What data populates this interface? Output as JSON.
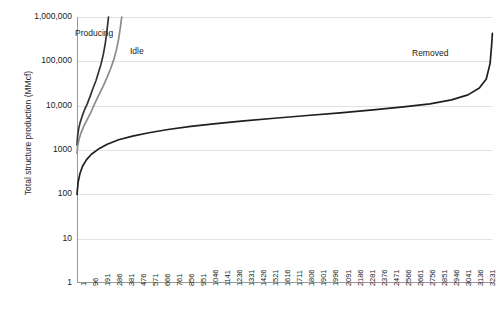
{
  "chart_data": {
    "type": "line",
    "title": "",
    "xlabel": "",
    "ylabel": "Total structure production (MMcf)",
    "yscale": "log",
    "ylim": [
      1,
      1000000
    ],
    "xlim": [
      1,
      3280
    ],
    "grid": true,
    "legend_position": "inline-annotations",
    "y_tick_labels": [
      "1,000,000",
      "100,000",
      "10,000",
      "1000",
      "100",
      "10",
      "1"
    ],
    "y_tick_values": [
      1000000,
      100000,
      10000,
      1000,
      100,
      10,
      1
    ],
    "x_tick_labels": [
      "1",
      "96",
      "191",
      "286",
      "381",
      "476",
      "571",
      "666",
      "761",
      "856",
      "951",
      "1046",
      "1141",
      "1236",
      "1331",
      "1426",
      "1521",
      "1616",
      "1711",
      "1806",
      "1901",
      "1996",
      "2091",
      "2186",
      "2281",
      "2376",
      "2471",
      "2566",
      "2661",
      "2756",
      "2851",
      "2946",
      "3041",
      "3136",
      "3231"
    ],
    "x_tick_values": [
      1,
      96,
      191,
      286,
      381,
      476,
      571,
      666,
      761,
      856,
      951,
      1046,
      1141,
      1236,
      1331,
      1426,
      1521,
      1616,
      1711,
      1806,
      1901,
      1996,
      2091,
      2186,
      2281,
      2376,
      2471,
      2566,
      2661,
      2756,
      2851,
      2946,
      3041,
      3136,
      3231
    ],
    "series": [
      {
        "name": "Producing",
        "color": "#333333",
        "label_position": {
          "x": 75,
          "y": 28
        },
        "points": [
          {
            "x": 1,
            "y": 1300
          },
          {
            "x": 6,
            "y": 2100
          },
          {
            "x": 14,
            "y": 3000
          },
          {
            "x": 26,
            "y": 4200
          },
          {
            "x": 42,
            "y": 5800
          },
          {
            "x": 60,
            "y": 8000
          },
          {
            "x": 82,
            "y": 11000
          },
          {
            "x": 104,
            "y": 16000
          },
          {
            "x": 126,
            "y": 24000
          },
          {
            "x": 150,
            "y": 36000
          },
          {
            "x": 170,
            "y": 55000
          },
          {
            "x": 190,
            "y": 85000
          },
          {
            "x": 208,
            "y": 140000
          },
          {
            "x": 222,
            "y": 230000
          },
          {
            "x": 232,
            "y": 360000
          },
          {
            "x": 240,
            "y": 560000
          },
          {
            "x": 246,
            "y": 800000
          },
          {
            "x": 250,
            "y": 1000000
          }
        ]
      },
      {
        "name": "Idle",
        "color": "#8c8c8c",
        "label_position": {
          "x": 130,
          "y": 46
        },
        "points": [
          {
            "x": 1,
            "y": 850
          },
          {
            "x": 6,
            "y": 1200
          },
          {
            "x": 16,
            "y": 1700
          },
          {
            "x": 32,
            "y": 2400
          },
          {
            "x": 54,
            "y": 3400
          },
          {
            "x": 80,
            "y": 4800
          },
          {
            "x": 110,
            "y": 7000
          },
          {
            "x": 140,
            "y": 11000
          },
          {
            "x": 172,
            "y": 17000
          },
          {
            "x": 206,
            "y": 27000
          },
          {
            "x": 238,
            "y": 43000
          },
          {
            "x": 268,
            "y": 70000
          },
          {
            "x": 294,
            "y": 115000
          },
          {
            "x": 314,
            "y": 190000
          },
          {
            "x": 330,
            "y": 320000
          },
          {
            "x": 342,
            "y": 540000
          },
          {
            "x": 350,
            "y": 820000
          },
          {
            "x": 355,
            "y": 1000000
          }
        ]
      },
      {
        "name": "Removed",
        "color": "#1f1f1f",
        "label_position": {
          "x": 412,
          "y": 48
        },
        "points": [
          {
            "x": 1,
            "y": 100
          },
          {
            "x": 10,
            "y": 190
          },
          {
            "x": 25,
            "y": 300
          },
          {
            "x": 45,
            "y": 430
          },
          {
            "x": 75,
            "y": 600
          },
          {
            "x": 115,
            "y": 800
          },
          {
            "x": 170,
            "y": 1050
          },
          {
            "x": 240,
            "y": 1350
          },
          {
            "x": 330,
            "y": 1700
          },
          {
            "x": 440,
            "y": 2050
          },
          {
            "x": 570,
            "y": 2450
          },
          {
            "x": 720,
            "y": 2900
          },
          {
            "x": 900,
            "y": 3400
          },
          {
            "x": 1100,
            "y": 3950
          },
          {
            "x": 1320,
            "y": 4550
          },
          {
            "x": 1560,
            "y": 5200
          },
          {
            "x": 1820,
            "y": 6000
          },
          {
            "x": 2080,
            "y": 6900
          },
          {
            "x": 2340,
            "y": 8000
          },
          {
            "x": 2580,
            "y": 9400
          },
          {
            "x": 2790,
            "y": 11000
          },
          {
            "x": 2960,
            "y": 13500
          },
          {
            "x": 3090,
            "y": 17500
          },
          {
            "x": 3180,
            "y": 25000
          },
          {
            "x": 3235,
            "y": 40000
          },
          {
            "x": 3265,
            "y": 90000
          },
          {
            "x": 3278,
            "y": 250000
          },
          {
            "x": 3283,
            "y": 430000
          }
        ]
      }
    ]
  },
  "axis": {
    "y_title": "Total structure production (MMcf)"
  }
}
